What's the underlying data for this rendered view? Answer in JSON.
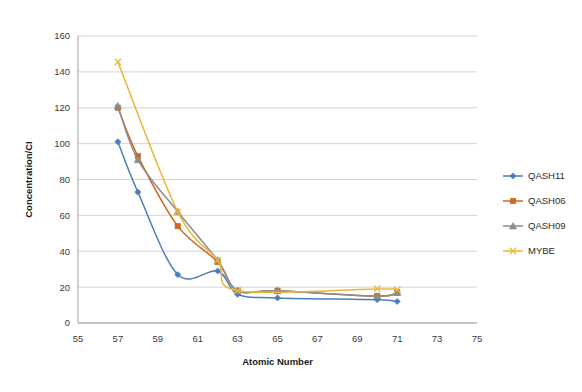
{
  "chart_data": {
    "type": "line",
    "title": "",
    "xlabel": "Atomic Number",
    "ylabel": "Concentration/CI",
    "xlim": [
      55,
      75
    ],
    "ylim": [
      0,
      160
    ],
    "xticks": [
      55,
      57,
      59,
      61,
      63,
      65,
      67,
      69,
      71,
      73,
      75
    ],
    "yticks": [
      0,
      20,
      40,
      60,
      80,
      100,
      120,
      140,
      160
    ],
    "grid": "horizontal",
    "legend_position": "right",
    "series": [
      {
        "name": "QASH11",
        "color": "#4a7ebb",
        "marker": "diamond",
        "x": [
          57,
          58,
          60,
          62,
          63,
          65,
          70,
          71
        ],
        "values": [
          101,
          73,
          27,
          29,
          16,
          14,
          13,
          12
        ]
      },
      {
        "name": "QASH06",
        "color": "#d1661f",
        "marker": "square",
        "x": [
          57,
          58,
          60,
          62,
          63,
          65,
          70,
          71
        ],
        "values": [
          120,
          93,
          54,
          34,
          18,
          18,
          15,
          17
        ]
      },
      {
        "name": "QASH09",
        "color": "#8c8c8c",
        "marker": "triangle",
        "x": [
          57,
          58,
          60,
          62,
          63,
          65,
          70,
          71
        ],
        "values": [
          121,
          91,
          62,
          35,
          18,
          18,
          15,
          17
        ]
      },
      {
        "name": "MYBE",
        "color": "#e8b73a",
        "marker": "x",
        "x": [
          57,
          60,
          62,
          63,
          70,
          71
        ],
        "values": [
          145.5,
          62,
          35,
          18,
          19,
          18.5
        ]
      }
    ]
  },
  "axes": {
    "x_title": "Atomic Number",
    "y_title": "Concentration/CI",
    "x_tick_labels": [
      "55",
      "57",
      "59",
      "61",
      "63",
      "65",
      "67",
      "69",
      "71",
      "73",
      "75"
    ],
    "y_tick_labels": [
      "0",
      "20",
      "40",
      "60",
      "80",
      "100",
      "120",
      "140",
      "160"
    ]
  },
  "legend": {
    "items": [
      {
        "label": "QASH11",
        "color": "#4a7ebb",
        "marker": "diamond"
      },
      {
        "label": "QASH06",
        "color": "#d1661f",
        "marker": "square"
      },
      {
        "label": "QASH09",
        "color": "#8c8c8c",
        "marker": "triangle"
      },
      {
        "label": "MYBE",
        "color": "#e8b73a",
        "marker": "x"
      }
    ]
  }
}
